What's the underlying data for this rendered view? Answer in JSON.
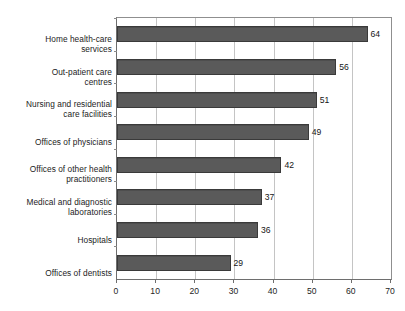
{
  "chart_data": {
    "type": "bar",
    "orientation": "horizontal",
    "title": "",
    "subtitle": "",
    "xlabel": "",
    "ylabel": "",
    "categories": [
      "Home health-care services",
      "Out-patient care centres",
      "Nursing and residential care facilities",
      "Offices of physicians",
      "Offices of other health practitioners",
      "Medical and diagnostic laboratories",
      "Hospitals",
      "Offices of dentists"
    ],
    "values": [
      64,
      56,
      51,
      49,
      42,
      37,
      36,
      29
    ],
    "value_labels": [
      "64",
      "56",
      "51",
      "49",
      "42",
      "37",
      "36",
      "29"
    ],
    "xlim": [
      0,
      70
    ],
    "xticks": [
      0,
      10,
      20,
      30,
      40,
      50,
      60,
      70
    ],
    "xtick_labels": [
      "0",
      "10",
      "20",
      "30",
      "40",
      "50",
      "60",
      "70"
    ],
    "grid": "vertical",
    "legend": "none",
    "series": [
      {
        "name": "",
        "values": [
          64,
          56,
          51,
          49,
          42,
          37,
          36,
          29
        ],
        "color": "#565656"
      }
    ]
  },
  "colors": {
    "bar_fill": "#565656",
    "bar_border": "#3a3a3a",
    "gridline": "#c4c4c4",
    "axis": "#6e6e6e",
    "plot_border": "#8f8f8f",
    "background": "#ffffff",
    "text": "#1c1c1c"
  },
  "category_label_lines": [
    [
      "Home health-care",
      "services"
    ],
    [
      "Out-patient care",
      "centres"
    ],
    [
      "Nursing and residential",
      "care facilities"
    ],
    [
      "Offices of physicians"
    ],
    [
      "Offices of other health",
      "practitioners"
    ],
    [
      "Medical and diagnostic",
      "laboratories"
    ],
    [
      "Hospitals"
    ],
    [
      "Offices of dentists"
    ]
  ]
}
